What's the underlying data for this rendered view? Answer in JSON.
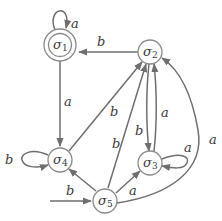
{
  "diagram": {
    "type": "finite-automaton",
    "colors": {
      "stroke": "#6e6e6e",
      "node_stroke": "#8a8a8a",
      "text": "#3a3a3a",
      "background": "#ffffff"
    },
    "states": [
      {
        "id": "s1",
        "name": "σ",
        "sub": "1",
        "accepting": true,
        "initial": false
      },
      {
        "id": "s2",
        "name": "σ",
        "sub": "2",
        "accepting": false,
        "initial": false
      },
      {
        "id": "s3",
        "name": "σ",
        "sub": "3",
        "accepting": false,
        "initial": false
      },
      {
        "id": "s4",
        "name": "σ",
        "sub": "4",
        "accepting": false,
        "initial": false
      },
      {
        "id": "s5",
        "name": "σ",
        "sub": "5",
        "accepting": false,
        "initial": true
      }
    ],
    "initial_label": "b",
    "transitions": [
      {
        "from": "s1",
        "to": "s1",
        "label": "a"
      },
      {
        "from": "s2",
        "to": "s1",
        "label": "b"
      },
      {
        "from": "s1",
        "to": "s4",
        "label": "a"
      },
      {
        "from": "s4",
        "to": "s4",
        "label": "b"
      },
      {
        "from": "s4",
        "to": "s2",
        "label": "b"
      },
      {
        "from": "s5",
        "to": "s2",
        "label": "b"
      },
      {
        "from": "s2",
        "to": "s3",
        "label": ""
      },
      {
        "from": "s3",
        "to": "s2",
        "label": "a"
      },
      {
        "from": "s3",
        "to": "s3",
        "label": "a"
      },
      {
        "from": "s5",
        "to": "s4",
        "label": ""
      },
      {
        "from": "s5",
        "to": "s3",
        "label": ""
      },
      {
        "from": "s5",
        "to": "s2",
        "label": "a"
      }
    ]
  }
}
